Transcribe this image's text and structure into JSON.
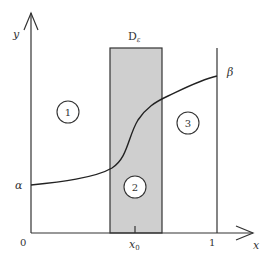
{
  "diagram": {
    "axes": {
      "x_label": "x",
      "y_label": "y",
      "origin_label": "0",
      "x_end_label": "1",
      "x0_label": "x",
      "x0_subscript": "0"
    },
    "region_label": {
      "main": "D",
      "subscript": "ε"
    },
    "curve_labels": {
      "left": "α",
      "right": "β"
    },
    "regions": [
      {
        "id": "1",
        "label": "1"
      },
      {
        "id": "2",
        "label": "2"
      },
      {
        "id": "3",
        "label": "3"
      }
    ],
    "colors": {
      "stroke": "#333333",
      "shaded_region": "#cfcfcf",
      "background": "#ffffff"
    }
  }
}
